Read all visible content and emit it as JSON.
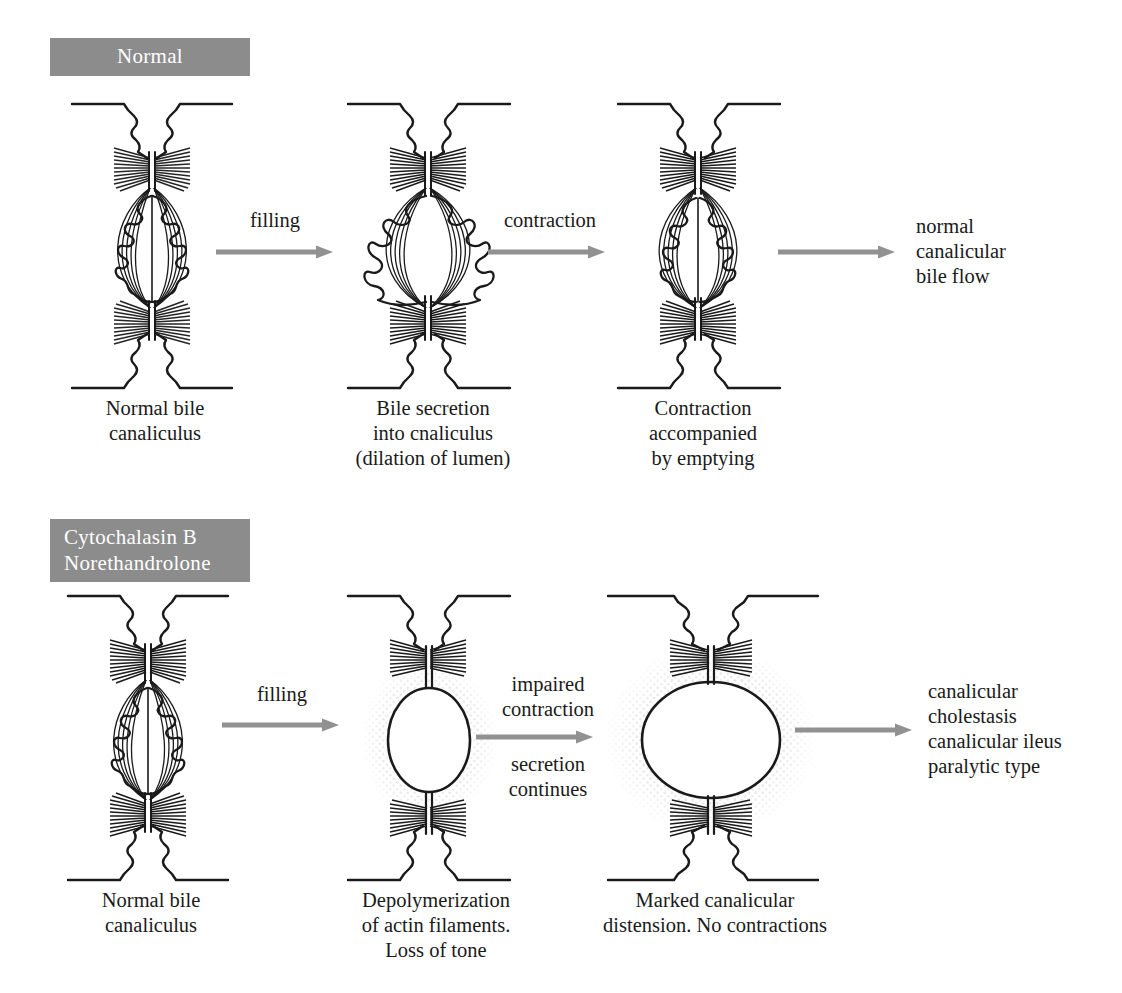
{
  "figure": {
    "type": "scientific-diagram",
    "palette": {
      "header_gray": "#8c8c8c",
      "arrow_gray": "#919191",
      "ink": "#1a1a1a",
      "background": "#ffffff"
    }
  },
  "rows": [
    {
      "id": "normal",
      "header": "Normal",
      "header_lines": [
        "Normal"
      ],
      "panels": [
        {
          "id": "normal-1",
          "caption": "Normal bile\ncanaliculus",
          "state": "resting"
        },
        {
          "id": "normal-2",
          "caption": "Bile secretion\ninto cnaliculus\n(dilation of lumen)",
          "state": "dilated"
        },
        {
          "id": "normal-3",
          "caption": "Contraction\naccompanied\nby emptying",
          "state": "contracted"
        }
      ],
      "arrows": [
        {
          "id": "normal-arrow-1",
          "label_above": "filling",
          "label_below": ""
        },
        {
          "id": "normal-arrow-2",
          "label_above": "contraction",
          "label_below": ""
        },
        {
          "id": "normal-arrow-3",
          "label_above": "",
          "label_below": ""
        }
      ],
      "outcome": "normal\ncanalicular\nbile flow"
    },
    {
      "id": "treated",
      "header": "Cytochalasin B Norethandrolone",
      "header_lines": [
        "Cytochalasin B",
        "Norethandrolone"
      ],
      "panels": [
        {
          "id": "treated-1",
          "caption": "Normal bile\ncanaliculus",
          "state": "resting"
        },
        {
          "id": "treated-2",
          "caption": "Depolymerization\nof actin filaments.\nLoss of tone",
          "state": "stippled-small"
        },
        {
          "id": "treated-3",
          "caption": "Marked canalicular\ndistension. No contractions",
          "state": "stippled-large"
        }
      ],
      "arrows": [
        {
          "id": "treated-arrow-1",
          "label_above": "filling",
          "label_below": ""
        },
        {
          "id": "treated-arrow-2",
          "label_above": "impaired\ncontraction",
          "label_below": "secretion\ncontinues"
        },
        {
          "id": "treated-arrow-3",
          "label_above": "",
          "label_below": ""
        }
      ],
      "outcome": "canalicular\ncholestasis\ncanalicular ileus\nparalytic type"
    }
  ]
}
